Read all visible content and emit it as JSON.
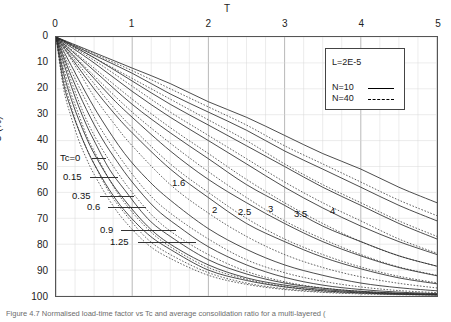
{
  "figure": {
    "caption": "Figure 4.7 Normalised load-time factor vs Tc and average consolidation ratio for a multi-layered ("
  },
  "axes": {
    "x_title": "T",
    "y_title": "U (%)",
    "x_ticks": [
      "0",
      "1",
      "2",
      "3",
      "4",
      "5"
    ],
    "y_ticks": [
      "0",
      "10",
      "20",
      "30",
      "40",
      "50",
      "60",
      "70",
      "80",
      "90",
      "100"
    ]
  },
  "legend": {
    "title": "L=2E-5",
    "n10_label": "N=10",
    "n40_label": "N=40"
  },
  "annotations": {
    "left": [
      {
        "text": "Tc=0",
        "x": 60,
        "y": 152,
        "leader_x": 92,
        "leader_w": 14
      },
      {
        "text": "0.15",
        "x": 63,
        "y": 171,
        "leader_x": 90,
        "leader_w": 28
      },
      {
        "text": "0.35",
        "x": 72,
        "y": 190,
        "leader_x": 100,
        "leader_w": 34
      },
      {
        "text": "0.6",
        "x": 87,
        "y": 201,
        "leader_x": 108,
        "leader_w": 38
      },
      {
        "text": "0.9",
        "x": 100,
        "y": 224,
        "leader_x": 121,
        "leader_w": 55
      },
      {
        "text": "1.25",
        "x": 110,
        "y": 236,
        "leader_x": 138,
        "leader_w": 58
      }
    ],
    "right": [
      {
        "text": "1.6",
        "x": 172,
        "y": 177
      },
      {
        "text": "2",
        "x": 212,
        "y": 204
      },
      {
        "text": "2.5",
        "x": 238,
        "y": 206
      },
      {
        "text": "3",
        "x": 268,
        "y": 203
      },
      {
        "text": "3.5",
        "x": 294,
        "y": 208
      },
      {
        "text": "4",
        "x": 330,
        "y": 205
      }
    ]
  },
  "chart_data": {
    "type": "line",
    "title": "",
    "xlabel": "T",
    "ylabel": "U (%)",
    "xlim": [
      0,
      5
    ],
    "ylim": [
      0,
      100
    ],
    "y_inverted": true,
    "x_axis_position": "top",
    "grid": {
      "major_x": 1,
      "minor_x": 0.25,
      "major_y": 10
    },
    "legend": {
      "position": "top-right",
      "entries": [
        "N=10",
        "N=40"
      ],
      "note": "L=2E-5"
    },
    "series_parameter": "Tc",
    "series": [
      {
        "name": "Tc=0 (N=10)",
        "style": "solid",
        "Tc": 0,
        "x": [
          0,
          0.1,
          0.2,
          0.3,
          0.4,
          0.5,
          0.7,
          0.9,
          1.2,
          1.5,
          2,
          2.5,
          3,
          3.5,
          4,
          4.5,
          5
        ],
        "y": [
          0,
          18,
          28,
          36,
          43,
          49,
          59,
          67,
          76,
          82,
          90,
          94,
          96.5,
          98,
          98.8,
          99.3,
          99.6
        ]
      },
      {
        "name": "Tc=0 (N=40)",
        "style": "dashed",
        "Tc": 0,
        "x": [
          0,
          0.1,
          0.2,
          0.3,
          0.4,
          0.5,
          0.7,
          0.9,
          1.2,
          1.5,
          2,
          2.5,
          3,
          3.5,
          4,
          4.5,
          5
        ],
        "y": [
          0,
          20,
          31,
          40,
          47,
          53,
          63,
          71,
          80,
          85.5,
          92,
          95.5,
          97.5,
          98.6,
          99.2,
          99.5,
          99.7
        ]
      },
      {
        "name": "Tc=0.15 (N=10)",
        "style": "solid",
        "Tc": 0.15,
        "x": [
          0,
          0.1,
          0.2,
          0.3,
          0.4,
          0.5,
          0.7,
          0.9,
          1.2,
          1.5,
          2,
          2.5,
          3,
          3.5,
          4,
          4.5,
          5
        ],
        "y": [
          0,
          14,
          24,
          32,
          39,
          45,
          55,
          63,
          73,
          80,
          88,
          93,
          95.8,
          97.5,
          98.5,
          99.1,
          99.4
        ]
      },
      {
        "name": "Tc=0.15 (N=40)",
        "style": "dashed",
        "Tc": 0.15,
        "x": [
          0,
          0.1,
          0.2,
          0.3,
          0.4,
          0.5,
          0.7,
          0.9,
          1.2,
          1.5,
          2,
          2.5,
          3,
          3.5,
          4,
          4.5,
          5
        ],
        "y": [
          0,
          16,
          27,
          36,
          43,
          49,
          60,
          68,
          78,
          84,
          91,
          95,
          97.2,
          98.4,
          99,
          99.4,
          99.6
        ]
      },
      {
        "name": "Tc=0.35 (N=10)",
        "style": "solid",
        "Tc": 0.35,
        "x": [
          0,
          0.1,
          0.2,
          0.3,
          0.4,
          0.5,
          0.7,
          0.9,
          1.2,
          1.5,
          2,
          2.5,
          3,
          3.5,
          4,
          4.5,
          5
        ],
        "y": [
          0,
          10,
          19,
          27,
          34,
          40,
          51,
          59,
          70,
          77,
          86,
          91.5,
          95,
          97,
          98.2,
          98.9,
          99.3
        ]
      },
      {
        "name": "Tc=0.35 (N=40)",
        "style": "dashed",
        "Tc": 0.35,
        "x": [
          0,
          0.1,
          0.2,
          0.3,
          0.4,
          0.5,
          0.7,
          0.9,
          1.2,
          1.5,
          2,
          2.5,
          3,
          3.5,
          4,
          4.5,
          5
        ],
        "y": [
          0,
          12,
          22,
          30,
          38,
          44,
          55,
          64,
          74,
          81,
          89,
          93.5,
          96.3,
          97.9,
          98.8,
          99.3,
          99.5
        ]
      },
      {
        "name": "Tc=0.6 (N=10)",
        "style": "solid",
        "Tc": 0.6,
        "x": [
          0,
          0.2,
          0.4,
          0.6,
          0.8,
          1,
          1.3,
          1.6,
          2,
          2.5,
          3,
          3.5,
          4,
          4.5,
          5
        ],
        "y": [
          0,
          15,
          28,
          39,
          48,
          56,
          66,
          73,
          81,
          88,
          92.8,
          95.8,
          97.5,
          98.5,
          99.1
        ]
      },
      {
        "name": "Tc=0.6 (N=40)",
        "style": "dashed",
        "Tc": 0.6,
        "x": [
          0,
          0.2,
          0.4,
          0.6,
          0.8,
          1,
          1.3,
          1.6,
          2,
          2.5,
          3,
          3.5,
          4,
          4.5,
          5
        ],
        "y": [
          0,
          17,
          32,
          43,
          52,
          60,
          70,
          77,
          84,
          90.5,
          94.5,
          96.9,
          98.2,
          99,
          99.4
        ]
      },
      {
        "name": "Tc=0.9 (N=10)",
        "style": "solid",
        "Tc": 0.9,
        "x": [
          0,
          0.2,
          0.4,
          0.6,
          0.9,
          1.2,
          1.5,
          2,
          2.5,
          3,
          3.5,
          4,
          4.5,
          5
        ],
        "y": [
          0,
          11,
          22,
          32,
          45,
          55,
          63,
          74,
          82,
          88,
          92,
          95,
          96.8,
          98
        ]
      },
      {
        "name": "Tc=0.9 (N=40)",
        "style": "dashed",
        "Tc": 0.9,
        "x": [
          0,
          0.2,
          0.4,
          0.6,
          0.9,
          1.2,
          1.5,
          2,
          2.5,
          3,
          3.5,
          4,
          4.5,
          5
        ],
        "y": [
          0,
          13,
          25,
          36,
          49,
          60,
          68,
          78,
          86,
          91,
          94.3,
          96.5,
          97.9,
          98.7
        ]
      },
      {
        "name": "Tc=1.25 (N=10)",
        "style": "solid",
        "Tc": 1.25,
        "x": [
          0,
          0.25,
          0.5,
          0.75,
          1,
          1.5,
          2,
          2.5,
          3,
          3.5,
          4,
          4.5,
          5
        ],
        "y": [
          0,
          10,
          20,
          29,
          37,
          51,
          62,
          72,
          79,
          85,
          89.5,
          93,
          95.3
        ]
      },
      {
        "name": "Tc=1.25 (N=40)",
        "style": "dashed",
        "Tc": 1.25,
        "x": [
          0,
          0.25,
          0.5,
          0.75,
          1,
          1.5,
          2,
          2.5,
          3,
          3.5,
          4,
          4.5,
          5
        ],
        "y": [
          0,
          11,
          23,
          33,
          42,
          57,
          68,
          77,
          84,
          89,
          92.6,
          95.1,
          96.9
        ]
      },
      {
        "name": "Tc=1.6 (N=10)",
        "style": "solid",
        "Tc": 1.6,
        "x": [
          0,
          0.25,
          0.5,
          0.75,
          1,
          1.5,
          2,
          2.5,
          3,
          3.5,
          4,
          4.5,
          5
        ],
        "y": [
          0,
          8,
          16,
          24,
          31,
          44,
          55,
          64,
          72,
          79,
          84.5,
          89,
          92.2
        ]
      },
      {
        "name": "Tc=1.6 (N=40)",
        "style": "dashed",
        "Tc": 1.6,
        "x": [
          0,
          0.25,
          0.5,
          0.75,
          1,
          1.5,
          2,
          2.5,
          3,
          3.5,
          4,
          4.5,
          5
        ],
        "y": [
          0,
          9,
          18,
          27,
          35,
          49,
          60,
          70,
          78,
          84,
          88.8,
          92.4,
          94.9
        ]
      },
      {
        "name": "Tc=2 (N=10)",
        "style": "solid",
        "Tc": 2,
        "x": [
          0,
          0.5,
          1,
          1.5,
          2,
          2.5,
          3,
          3.5,
          4,
          4.5,
          5
        ],
        "y": [
          0,
          13,
          26,
          37,
          47,
          57,
          65,
          73,
          79,
          84.5,
          88.5
        ]
      },
      {
        "name": "Tc=2 (N=40)",
        "style": "dashed",
        "Tc": 2,
        "x": [
          0,
          0.5,
          1,
          1.5,
          2,
          2.5,
          3,
          3.5,
          4,
          4.5,
          5
        ],
        "y": [
          0,
          15,
          29,
          41,
          52,
          62,
          71,
          78,
          84,
          88.8,
          92
        ]
      },
      {
        "name": "Tc=2.5 (N=10)",
        "style": "solid",
        "Tc": 2.5,
        "x": [
          0,
          0.5,
          1,
          1.5,
          2,
          2.5,
          3,
          3.5,
          4,
          4.5,
          5
        ],
        "y": [
          0,
          10,
          21,
          31,
          40,
          49,
          58,
          66,
          73,
          79,
          84
        ]
      },
      {
        "name": "Tc=2.5 (N=40)",
        "style": "dashed",
        "Tc": 2.5,
        "x": [
          0,
          0.5,
          1,
          1.5,
          2,
          2.5,
          3,
          3.5,
          4,
          4.5,
          5
        ],
        "y": [
          0,
          12,
          24,
          35,
          45,
          55,
          64,
          72,
          79,
          84.5,
          88.5
        ]
      },
      {
        "name": "Tc=3 (N=10)",
        "style": "solid",
        "Tc": 3,
        "x": [
          0,
          0.5,
          1,
          1.5,
          2,
          2.5,
          3,
          3.5,
          4,
          4.5,
          5
        ],
        "y": [
          0,
          8,
          17,
          26,
          34,
          42,
          50,
          58,
          65,
          72,
          78
        ]
      },
      {
        "name": "Tc=3 (N=40)",
        "style": "dashed",
        "Tc": 3,
        "x": [
          0,
          0.5,
          1,
          1.5,
          2,
          2.5,
          3,
          3.5,
          4,
          4.5,
          5
        ],
        "y": [
          0,
          9,
          19,
          29,
          38,
          47,
          56,
          64,
          71,
          78,
          83.5
        ]
      },
      {
        "name": "Tc=3.5 (N=10)",
        "style": "solid",
        "Tc": 3.5,
        "x": [
          0,
          0.5,
          1,
          1.5,
          2,
          2.5,
          3,
          3.5,
          4,
          4.5,
          5
        ],
        "y": [
          0,
          7,
          14,
          22,
          29,
          36,
          44,
          51,
          58,
          65,
          71
        ]
      },
      {
        "name": "Tc=3.5 (N=40)",
        "style": "dashed",
        "Tc": 3.5,
        "x": [
          0,
          0.5,
          1,
          1.5,
          2,
          2.5,
          3,
          3.5,
          4,
          4.5,
          5
        ],
        "y": [
          0,
          8,
          16,
          24,
          32,
          40,
          49,
          57,
          64,
          71,
          77
        ]
      },
      {
        "name": "Tc=4 (N=10)",
        "style": "solid",
        "Tc": 4,
        "x": [
          0,
          0.5,
          1,
          1.5,
          2,
          2.5,
          3,
          3.5,
          4,
          4.5,
          5
        ],
        "y": [
          0,
          6,
          12,
          18,
          25,
          31,
          38,
          45,
          51,
          58,
          64
        ]
      },
      {
        "name": "Tc=4 (N=40)",
        "style": "dashed",
        "Tc": 4,
        "x": [
          0,
          0.5,
          1,
          1.5,
          2,
          2.5,
          3,
          3.5,
          4,
          4.5,
          5
        ],
        "y": [
          0,
          6.5,
          13,
          20,
          27,
          34,
          42,
          49,
          56,
          63,
          69
        ]
      }
    ]
  }
}
